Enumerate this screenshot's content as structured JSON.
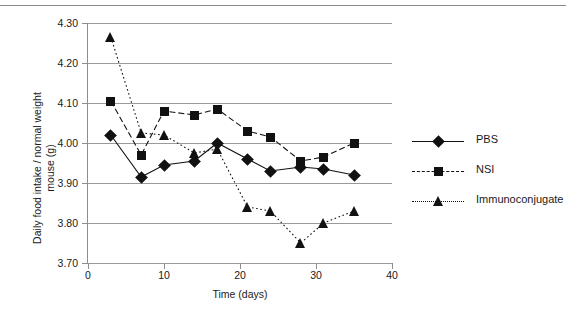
{
  "figure": {
    "axis_title_x": "Time (days)",
    "axis_title_y_line1": "Daily food intake / normal weight",
    "axis_title_y_line2": "mouse (g)"
  },
  "legend": {
    "items": [
      {
        "label": "PBS",
        "marker": "diamond-marker",
        "line": "solid",
        "color": "#111111"
      },
      {
        "label": "NSI",
        "marker": "square-marker",
        "line": "dashed",
        "color": "#111111"
      },
      {
        "label": "Immunoconjugate",
        "marker": "triangle-marker",
        "line": "dotted",
        "color": "#111111"
      }
    ]
  },
  "chart_data": {
    "type": "line",
    "title": "",
    "xlabel": "Time (days)",
    "ylabel": "Daily food intake / normal weight mouse (g)",
    "xlim": [
      0,
      40
    ],
    "ylim": [
      3.7,
      4.3
    ],
    "xticks": [
      0,
      10,
      20,
      30,
      40
    ],
    "yticks": [
      3.7,
      3.8,
      3.9,
      4.0,
      4.1,
      4.2,
      4.3
    ],
    "ytick_labels": [
      "3.70",
      "3.80",
      "3.90",
      "4.00",
      "4.10",
      "4.20",
      "4.30"
    ],
    "xtick_labels": [
      "0",
      "10",
      "20",
      "30",
      "40"
    ],
    "grid": "horizontal",
    "legend_position": "right",
    "x": [
      3,
      7,
      10,
      14,
      17,
      21,
      24,
      28,
      31,
      35
    ],
    "series": [
      {
        "name": "PBS",
        "marker": "diamond",
        "linestyle": "solid",
        "color": "#111111",
        "values": [
          4.02,
          3.915,
          3.945,
          3.955,
          4.0,
          3.96,
          3.93,
          3.94,
          3.935,
          3.92
        ]
      },
      {
        "name": "NSI",
        "marker": "square",
        "linestyle": "dashed",
        "color": "#111111",
        "values": [
          4.105,
          3.97,
          4.08,
          4.07,
          4.085,
          4.03,
          4.015,
          3.955,
          3.965,
          4.0
        ]
      },
      {
        "name": "Immunoconjugate",
        "marker": "triangle",
        "linestyle": "dotted",
        "color": "#111111",
        "values": [
          4.265,
          4.025,
          4.02,
          3.975,
          3.985,
          3.84,
          3.83,
          3.75,
          3.8,
          3.83
        ]
      }
    ]
  }
}
